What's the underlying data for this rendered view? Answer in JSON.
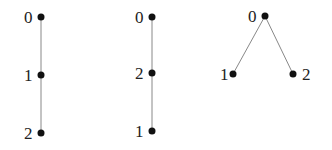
{
  "diagram": {
    "type": "rooted trees / posets on 3 elements",
    "graphs": [
      {
        "id": "graph-1",
        "nodes": [
          {
            "label": "0",
            "x": 41,
            "y": 17,
            "lx": 24,
            "ly": 23
          },
          {
            "label": "1",
            "x": 41,
            "y": 75,
            "lx": 24,
            "ly": 81
          },
          {
            "label": "2",
            "x": 41,
            "y": 133,
            "lx": 24,
            "ly": 139
          }
        ],
        "edges": [
          [
            0,
            1
          ],
          [
            1,
            2
          ]
        ]
      },
      {
        "id": "graph-2",
        "nodes": [
          {
            "label": "0",
            "x": 152,
            "y": 17,
            "lx": 135,
            "ly": 23
          },
          {
            "label": "2",
            "x": 152,
            "y": 73,
            "lx": 135,
            "ly": 79
          },
          {
            "label": "1",
            "x": 152,
            "y": 131,
            "lx": 135,
            "ly": 137
          }
        ],
        "edges": [
          [
            0,
            1
          ],
          [
            1,
            2
          ]
        ]
      },
      {
        "id": "graph-3",
        "nodes": [
          {
            "label": "0",
            "x": 265,
            "y": 16,
            "lx": 248,
            "ly": 22
          },
          {
            "label": "1",
            "x": 233,
            "y": 74,
            "lx": 220,
            "ly": 80
          },
          {
            "label": "2",
            "x": 293,
            "y": 74,
            "lx": 302,
            "ly": 80
          }
        ],
        "edges": [
          [
            0,
            1
          ],
          [
            0,
            2
          ]
        ]
      }
    ]
  }
}
